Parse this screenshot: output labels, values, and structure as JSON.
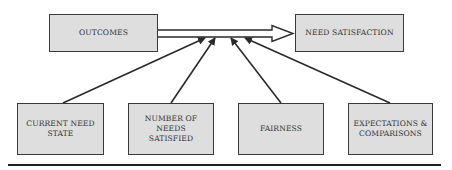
{
  "diagram": {
    "top": {
      "outcomes": "OUTCOMES",
      "need_satisfaction": "NEED SATISFACTION"
    },
    "bottom": [
      {
        "line1": "CURRENT NEED",
        "line2": "STATE"
      },
      {
        "line1": "NUMBER OF NEEDS",
        "line2": "SATISFIED"
      },
      {
        "line1": "FAIRNESS",
        "line2": ""
      },
      {
        "line1": "EXPECTATIONS &",
        "line2": "COMPARISONS"
      }
    ],
    "edges": [
      {
        "from": "OUTCOMES",
        "to": "NEED SATISFACTION",
        "style": "hollow-double-arrow"
      },
      {
        "from": "CURRENT NEED STATE",
        "to": "main-arrow"
      },
      {
        "from": "NUMBER OF NEEDS SATISFIED",
        "to": "main-arrow"
      },
      {
        "from": "FAIRNESS",
        "to": "main-arrow"
      },
      {
        "from": "EXPECTATIONS & COMPARISONS",
        "to": "main-arrow"
      }
    ]
  }
}
